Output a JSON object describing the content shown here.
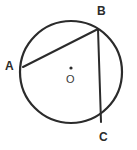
{
  "figure": {
    "kind": "circle-geometry-diagram",
    "background_color": "#ffffff",
    "stroke_color": "#2b2b2b",
    "label_color": "#2b2b2b"
  },
  "circle": {
    "name": "circle-outline",
    "center_x": 71,
    "center_y": 72,
    "radius": 51,
    "stroke_width": 2.2,
    "fill": "none"
  },
  "center_marker": {
    "name": "center-point",
    "dot_x": 71,
    "dot_y": 68,
    "dot_radius": 1.6,
    "label": "O",
    "label_x": 66,
    "label_y": 74
  },
  "points": [
    {
      "id": "A",
      "label": "A",
      "x": 23,
      "y": 67,
      "label_x": 5,
      "label_y": 60
    },
    {
      "id": "B",
      "label": "B",
      "x": 98,
      "y": 29,
      "label_x": 97,
      "label_y": 5
    },
    {
      "id": "C",
      "label": "C",
      "x": 101,
      "y": 122,
      "label_x": 99,
      "label_y": 131
    }
  ],
  "chords": [
    {
      "id": "AB",
      "from": "A",
      "to": "B",
      "x1": 23,
      "y1": 67,
      "x2": 98,
      "y2": 29,
      "stroke_width": 2.0
    },
    {
      "id": "BC",
      "from": "B",
      "to": "C",
      "x1": 98,
      "y1": 29,
      "x2": 101,
      "y2": 122,
      "stroke_width": 2.0
    }
  ]
}
